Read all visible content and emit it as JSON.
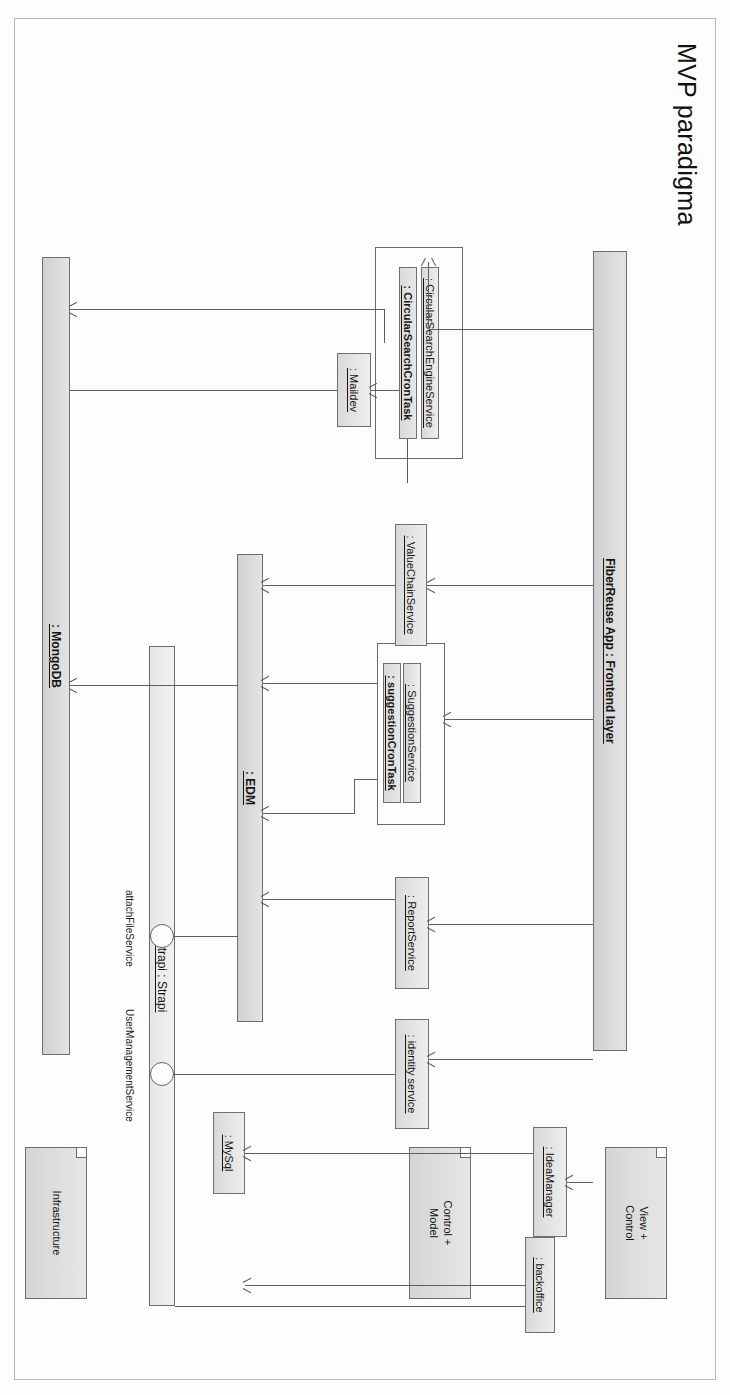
{
  "diagram": {
    "title": "MVP paradigma",
    "type": "uml-component-diagram"
  },
  "legend": {
    "items": [
      {
        "id": "view-control",
        "label": "View +\nControl"
      },
      {
        "id": "control-model",
        "label": "Control +\nModel"
      },
      {
        "id": "infrastructure",
        "label": "Infrastructure"
      }
    ]
  },
  "nodes": {
    "frontend_layer": "FiberReuse App : Frontend layer",
    "backoffice": ": backoffice",
    "idea_manager": ": IdeaManager",
    "identity_service": ": identity service",
    "report_service": ": ReportService",
    "suggestion_service": ": SuggestionService",
    "suggestion_cron_task": ": suggestionCronTask",
    "value_chain_service": ": ValueChainService",
    "circular_search_engine_service": ": CircularSearchEngineService",
    "circular_search_cron_task": ": CircularSearchCronTask",
    "maildev": ": Maildev",
    "edm": ": EDM",
    "strapi": "Strapi : Strapi",
    "mysql": ": MySql",
    "mongodb": ": MongoDB"
  },
  "interfaces": {
    "attach_file_service": "attachFileService",
    "user_management_service": "UserManagementService"
  },
  "colors": {
    "node_fill": "#dcdcdc",
    "node_stroke": "#6e6e6e",
    "line": "#5f5f5f",
    "page": "#fdfdfd",
    "text": "#161616"
  }
}
